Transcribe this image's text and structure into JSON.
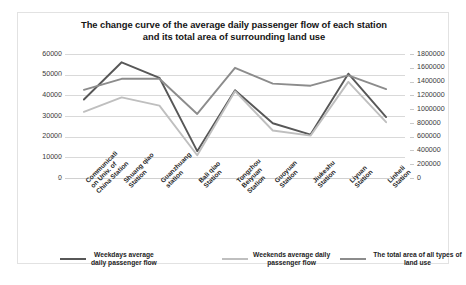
{
  "chart_data": {
    "type": "line",
    "title": "The change curve of the average daily passenger flow of each station and its total area of surrounding land use",
    "title_line1": "The change curve of the average daily passenger flow of each station",
    "title_line2": "and its total area of surrounding land use",
    "xlabel": "",
    "ylabel": "",
    "grid": true,
    "legend_position": "bottom",
    "categories": [
      "Communication Univ. of China Station",
      "Shuang qiao Station",
      "Guanzhuang Station",
      "Bali qiao Station",
      "Tongzhou Beiyuan Station",
      "Guoyuan Station",
      "Jiukeshu Station",
      "Liyuan Station",
      "Linheli Station"
    ],
    "categories_wrapped": [
      [
        "Communicati",
        "on Univ. of",
        "China Station"
      ],
      [
        "Shuang qiao",
        "Station"
      ],
      [
        "Guanzhuang",
        "station"
      ],
      [
        "Bali qiao",
        "Station"
      ],
      [
        "Tongzhou",
        "Beiyuan",
        "Station"
      ],
      [
        "Guoyuan",
        "Station"
      ],
      [
        "Jiukeshu",
        "Station"
      ],
      [
        "Liyuan",
        "Station"
      ],
      [
        "Linheli",
        "Station"
      ]
    ],
    "axes": {
      "left": {
        "ticks": [
          "60000",
          "50000",
          "40000",
          "30000",
          "20000",
          "10000",
          "0"
        ],
        "min": 0,
        "max": 60000,
        "step": 10000
      },
      "right": {
        "ticks": [
          "1800000",
          "1600000",
          "1400000",
          "1200000",
          "1000000",
          "800000",
          "600000",
          "400000",
          "200000",
          "0"
        ],
        "min": 0,
        "max": 1800000,
        "step": 200000
      }
    },
    "series": [
      {
        "name": "Weekdays average daily passenger flow",
        "name_line1": "Weekdays average",
        "name_line2": "daily passenger flow",
        "axis": "left",
        "color": "#575757",
        "values": [
          38000,
          56000,
          48500,
          13000,
          42500,
          26500,
          21000,
          50500,
          29500
        ]
      },
      {
        "name": "Weekends average daily passenger flow",
        "name_line1": "Weekends average daily",
        "name_line2": "passenger flow",
        "axis": "left",
        "color": "#bfbfbf",
        "values": [
          32000,
          39000,
          35000,
          11000,
          42000,
          23000,
          20500,
          46500,
          27000
        ]
      },
      {
        "name": "The total area of all types of land use",
        "name_line1": "The total area of all types of land use",
        "name_line2": "",
        "axis": "right",
        "color": "#8c8c8c",
        "values": [
          1280000,
          1440000,
          1440000,
          930000,
          1600000,
          1370000,
          1340000,
          1490000,
          1290000
        ]
      }
    ]
  }
}
